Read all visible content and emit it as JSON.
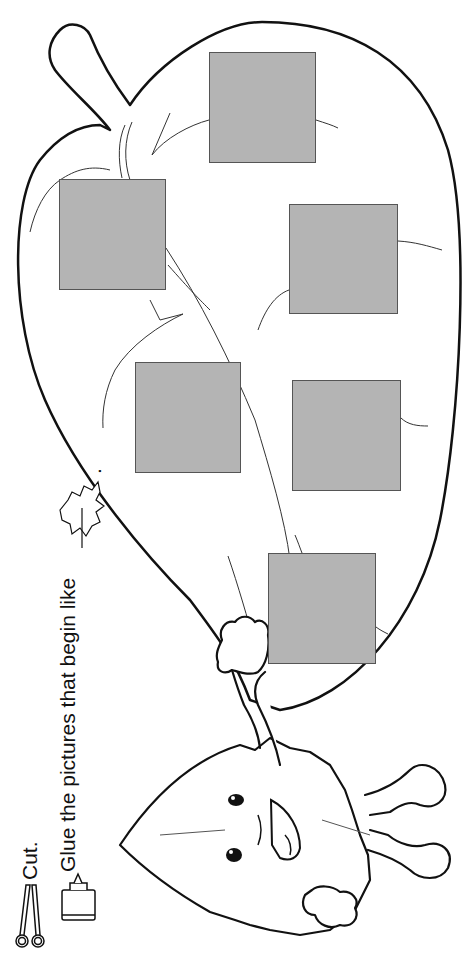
{
  "instructions": {
    "step1": "Cut.",
    "step2": "Glue the pictures that begin like",
    "step2_suffix": ".",
    "target_icon": "maple-leaf-icon"
  },
  "icons": {
    "scissors": "scissors-icon",
    "glue": "glue-bottle-icon",
    "leaf": "maple-leaf-icon"
  },
  "glue_boxes": [
    {
      "id": 1,
      "x": 209,
      "y": 52,
      "w": 107,
      "h": 111
    },
    {
      "id": 2,
      "x": 59,
      "y": 179,
      "w": 107,
      "h": 111
    },
    {
      "id": 3,
      "x": 289,
      "y": 204,
      "w": 109,
      "h": 110
    },
    {
      "id": 4,
      "x": 135,
      "y": 362,
      "w": 106,
      "h": 111
    },
    {
      "id": 5,
      "x": 292,
      "y": 380,
      "w": 109,
      "h": 111
    },
    {
      "id": 6,
      "x": 268,
      "y": 553,
      "w": 108,
      "h": 111
    }
  ],
  "colors": {
    "box_fill": "#b4b4b4",
    "line": "#111111"
  }
}
